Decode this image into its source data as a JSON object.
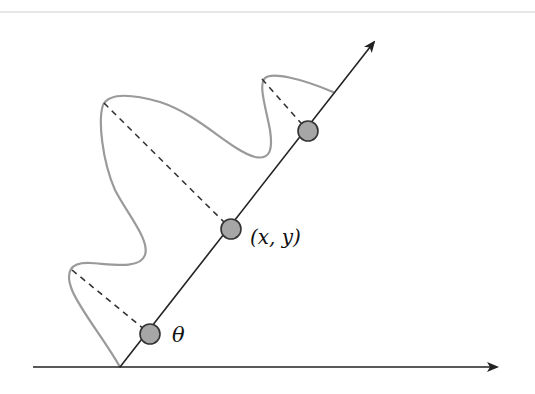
{
  "diagram": {
    "labels": {
      "theta": "θ",
      "point": "(x, y)"
    },
    "colors": {
      "axis": "#222222",
      "curve": "#9a9a9a",
      "dashed": "#333333",
      "circle_fill": "#a6a6a6",
      "circle_stroke": "#333333",
      "top_rule": "#c8c8c8"
    },
    "elements": {
      "horizontal_axis": "horizontal axis with arrow",
      "rotated_axis": "rotated axis with arrow",
      "curve": "profile curve",
      "points": [
        "θ point",
        "(x, y) point",
        "upper point"
      ]
    }
  }
}
